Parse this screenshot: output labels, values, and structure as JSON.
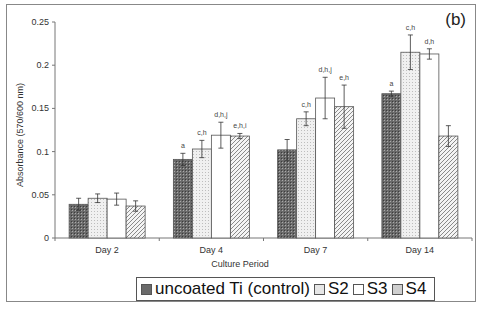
{
  "chart_data": {
    "type": "bar",
    "panel_label": "(b)",
    "title": "",
    "xlabel": "Culture Period",
    "ylabel": "Absorbance (570/600 nm)",
    "ylim": [
      0,
      0.25
    ],
    "yticks": [
      "0",
      "0.05",
      "0.1",
      "0.15",
      "0.2",
      "0.25"
    ],
    "categories": [
      "Day 2",
      "Day 4",
      "Day 7",
      "Day 14"
    ],
    "series": [
      {
        "name": "uncoated Ti (control)",
        "values": [
          0.039,
          0.091,
          0.102,
          0.167
        ],
        "errors": [
          0.007,
          0.007,
          0.012,
          0.003
        ],
        "annotations": [
          "",
          "a",
          "",
          "a"
        ]
      },
      {
        "name": "S2",
        "values": [
          0.046,
          0.103,
          0.138,
          0.215
        ],
        "errors": [
          0.005,
          0.01,
          0.008,
          0.02
        ],
        "annotations": [
          "",
          "c,h",
          "c,h",
          "c,h"
        ]
      },
      {
        "name": "S3",
        "values": [
          0.045,
          0.119,
          0.162,
          0.213
        ],
        "errors": [
          0.007,
          0.015,
          0.024,
          0.006
        ],
        "annotations": [
          "",
          "d,h,j",
          "d,h,j",
          "d,h"
        ]
      },
      {
        "name": "S4",
        "values": [
          0.037,
          0.118,
          0.152,
          0.118
        ],
        "errors": [
          0.006,
          0.003,
          0.025,
          0.012
        ],
        "annotations": [
          "",
          "e,h,i",
          "e,h",
          ""
        ]
      }
    ],
    "legend_position": "bottom",
    "grid": false
  }
}
